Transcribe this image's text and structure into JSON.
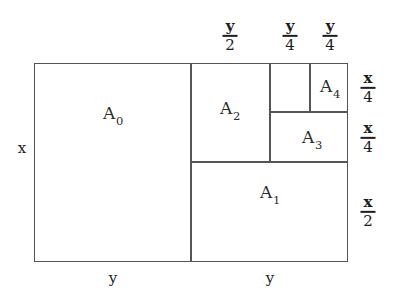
{
  "figure": {
    "background_color": "#ffffff",
    "line_color": "#555555",
    "text_color": "#232323",
    "outer_rect": {
      "x": 34,
      "y": 63,
      "width": 314,
      "height": 199
    },
    "regions": [
      {
        "id": "A0",
        "label": "A",
        "subscript": "0",
        "x": 34,
        "y": 63,
        "width": 157,
        "height": 199,
        "center_x": 113,
        "center_y": 115
      },
      {
        "id": "A1",
        "label": "A",
        "subscript": "1",
        "x": 191,
        "y": 162,
        "width": 157,
        "height": 100,
        "center_x": 270,
        "center_y": 194
      },
      {
        "id": "A2",
        "label": "A",
        "subscript": "2",
        "x": 191,
        "y": 63,
        "width": 79,
        "height": 99,
        "center_x": 230,
        "center_y": 110
      },
      {
        "id": "A3",
        "label": "A",
        "subscript": "3",
        "x": 270,
        "y": 112,
        "width": 78,
        "height": 50,
        "center_x": 312,
        "center_y": 139
      },
      {
        "id": "A4",
        "label": "A",
        "subscript": "4",
        "x": 310,
        "y": 63,
        "width": 38,
        "height": 49,
        "center_x": 330,
        "center_y": 88
      },
      {
        "id": "A5",
        "label": "",
        "subscript": "",
        "x": 270,
        "y": 63,
        "width": 40,
        "height": 49,
        "center_x": 290,
        "center_y": 88
      }
    ],
    "top_labels": [
      {
        "id": "top-y-over-2",
        "numerator": "y",
        "denominator": "2",
        "center_x": 230,
        "center_y": 36
      },
      {
        "id": "top-y-over-4-left",
        "numerator": "y",
        "denominator": "4",
        "center_x": 290,
        "center_y": 36
      },
      {
        "id": "top-y-over-4-right",
        "numerator": "y",
        "denominator": "4",
        "center_x": 330,
        "center_y": 36
      }
    ],
    "right_labels": [
      {
        "id": "right-x-over-4-upper",
        "numerator": "x",
        "denominator": "4",
        "center_x": 368,
        "center_y": 88
      },
      {
        "id": "right-x-over-4-lower",
        "numerator": "x",
        "denominator": "4",
        "center_x": 368,
        "center_y": 138
      },
      {
        "id": "right-x-over-2",
        "numerator": "x",
        "denominator": "2",
        "center_x": 368,
        "center_y": 212
      }
    ],
    "left_labels": [
      {
        "id": "left-x",
        "text": "x",
        "center_x": 22,
        "center_y": 148
      }
    ],
    "bottom_labels": [
      {
        "id": "bottom-y-left",
        "text": "y",
        "center_x": 113,
        "center_y": 278
      },
      {
        "id": "bottom-y-right",
        "text": "y",
        "center_x": 270,
        "center_y": 278
      }
    ]
  }
}
